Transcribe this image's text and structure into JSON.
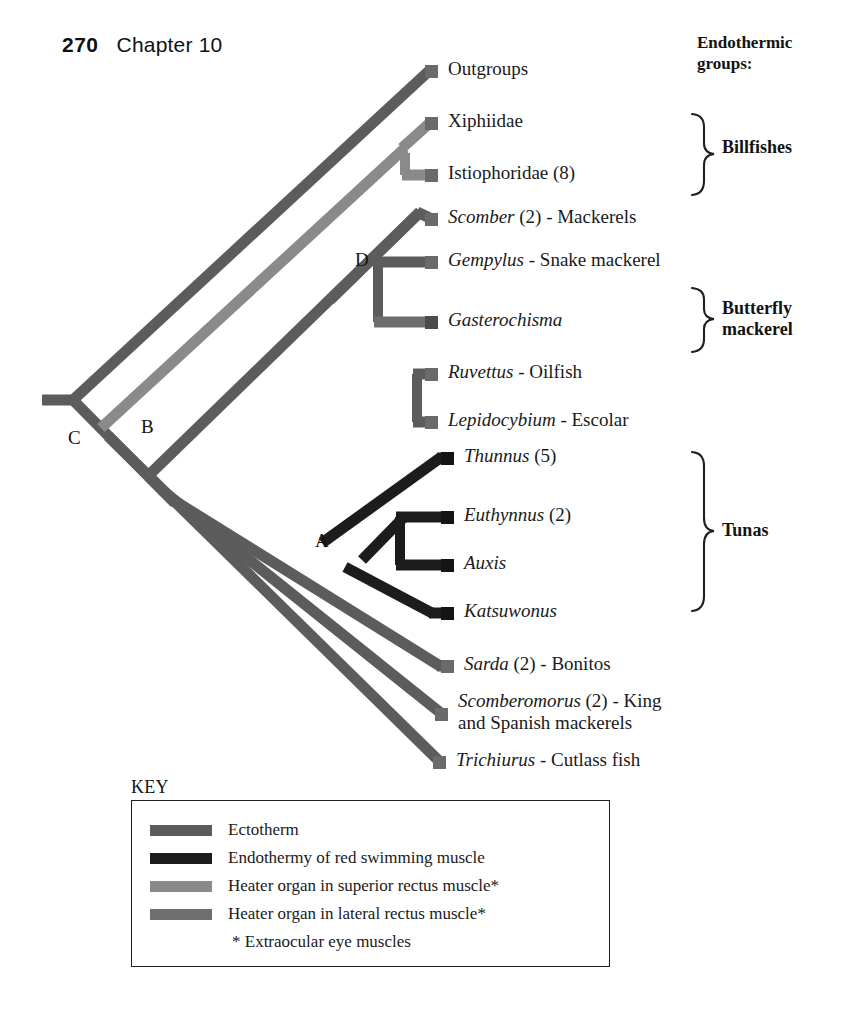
{
  "page": {
    "folio": "270",
    "chapter": "Chapter 10"
  },
  "figure": {
    "type": "cladogram"
  },
  "tips": [
    {
      "id": "outgroups",
      "sci": "",
      "rest": "Outgroups",
      "state": "ectotherm"
    },
    {
      "id": "xiphiidae",
      "sci": "",
      "rest": "Xiphiidae",
      "state": "superior_rectus"
    },
    {
      "id": "istiophoridae",
      "sci": "",
      "rest": "Istiophoridae (8)",
      "state": "superior_rectus"
    },
    {
      "id": "scomber",
      "sci": "Scomber",
      "rest": " (2) - Mackerels",
      "state": "ectotherm"
    },
    {
      "id": "gempylus",
      "sci": "Gempylus",
      "rest": " - Snake mackerel",
      "state": "ectotherm"
    },
    {
      "id": "gasterochisma",
      "sci": "Gasterochisma",
      "rest": "",
      "state": "lateral_rectus"
    },
    {
      "id": "ruvettus",
      "sci": "Ruvettus",
      "rest": " - Oilfish",
      "state": "ectotherm"
    },
    {
      "id": "lepidocybium",
      "sci": "Lepidocybium",
      "rest": " - Escolar",
      "state": "ectotherm"
    },
    {
      "id": "thunnus",
      "sci": "Thunnus",
      "rest": " (5)",
      "state": "endotherm"
    },
    {
      "id": "euthynnus",
      "sci": "Euthynnus",
      "rest": " (2)",
      "state": "endotherm"
    },
    {
      "id": "auxis",
      "sci": "Auxis",
      "rest": "",
      "state": "endotherm"
    },
    {
      "id": "katsuwonus",
      "sci": "Katsuwonus",
      "rest": "",
      "state": "endotherm"
    },
    {
      "id": "sarda",
      "sci": "Sarda",
      "rest": " (2) - Bonitos",
      "state": "ectotherm"
    },
    {
      "id": "scomberomorus",
      "sci": "Scomberomorus",
      "rest": " (2) - King",
      "rest2": "and Spanish mackerels",
      "state": "ectotherm"
    },
    {
      "id": "trichiurus",
      "sci": "Trichiurus",
      "rest": " - Cutlass fish",
      "state": "ectotherm"
    }
  ],
  "node_letters": [
    {
      "id": "node-a",
      "label": "A"
    },
    {
      "id": "node-b",
      "label": "B"
    },
    {
      "id": "node-c",
      "label": "C"
    },
    {
      "id": "node-d",
      "label": "D"
    }
  ],
  "groups": {
    "heading_line1": "Endothermic",
    "heading_line2": "groups:",
    "items": [
      {
        "id": "billfishes",
        "line1": "Billfishes",
        "line2": ""
      },
      {
        "id": "butterfly",
        "line1": "Butterfly",
        "line2": "mackerel"
      },
      {
        "id": "tunas",
        "line1": "Tunas",
        "line2": ""
      }
    ]
  },
  "key": {
    "title": "KEY",
    "rows": [
      {
        "id": "ectotherm",
        "color": "#5c5c5c",
        "text": "Ectotherm"
      },
      {
        "id": "endotherm",
        "color": "#1c1c1c",
        "text": "Endothermy of red swimming muscle"
      },
      {
        "id": "superior-rectus",
        "color": "#8a8a8a",
        "text": "Heater organ in superior rectus muscle*"
      },
      {
        "id": "lateral-rectus",
        "color": "#6e6e6e",
        "text": "Heater organ in lateral rectus muscle*"
      },
      {
        "id": "footnote",
        "color": "",
        "text": "* Extraocular eye muscles"
      }
    ]
  },
  "colors": {
    "ectotherm": "#5c5c5c",
    "endotherm": "#1c1c1c",
    "superior_rectus": "#8a8a8a",
    "lateral_rectus": "#6e6e6e",
    "text": "#1a1a1a",
    "background": "#ffffff"
  }
}
